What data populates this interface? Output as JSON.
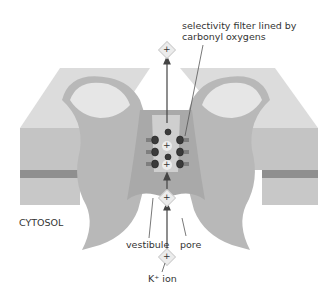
{
  "diagram": {
    "labels": {
      "selectivity_filter": "selectivity filter lined by",
      "selectivity_filter_line2": "carbonyl oxygens",
      "cytosol": "CYTOSOL",
      "vestibule": "vestibule",
      "pore": "pore",
      "ion": "K⁺ ion"
    },
    "ion_symbol": "+",
    "colors": {
      "membrane_top": "#d9d9d9",
      "membrane_side": "#bdbdbd",
      "membrane_dark": "#8c8c8c",
      "channel": "#b5b5b5",
      "channel_light": "#e6e6e6",
      "ion_fill": "#ececec",
      "oxygen": "#3a3a3a",
      "arrow": "#444444"
    }
  }
}
